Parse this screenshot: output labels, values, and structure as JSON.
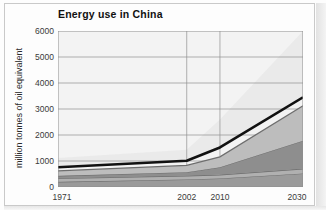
{
  "chart_data": {
    "type": "area",
    "title": "Energy use in China",
    "xlabel": "",
    "ylabel": "million tonnes of oil equivalent",
    "x": [
      1971,
      2002,
      2010,
      2030
    ],
    "x_tick_labels": [
      "1971",
      "2002",
      "2010",
      "2030"
    ],
    "y_tick_labels": [
      "0",
      "1000",
      "2000",
      "3000",
      "4000",
      "5000",
      "6000"
    ],
    "y_ticks": [
      0,
      1000,
      2000,
      3000,
      4000,
      5000,
      6000
    ],
    "ylim": [
      0,
      6000
    ],
    "xlim": [
      1971,
      2030
    ],
    "grid": true,
    "legend": "none",
    "stacked": true,
    "series": [
      {
        "name": "band-1",
        "color": "#9a9a9a",
        "values": [
          200,
          290,
          330,
          520
        ]
      },
      {
        "name": "band-2",
        "color": "#b0b0b0",
        "values": [
          330,
          430,
          470,
          700
        ]
      },
      {
        "name": "band-3",
        "color": "#8e8e8e",
        "values": [
          430,
          570,
          760,
          1780
        ]
      },
      {
        "name": "band-4",
        "color": "#bdbdbd",
        "values": [
          620,
          830,
          1160,
          3120
        ]
      },
      {
        "name": "total-line",
        "color": "#121212",
        "values": [
          760,
          1010,
          1520,
          3450
        ]
      },
      {
        "name": "projection-wedge",
        "color": "#e7e7e7",
        "values": [
          1120,
          1430,
          2600,
          6000
        ]
      }
    ]
  },
  "colors": {
    "plot_background": "#f3f3f3",
    "gridline": "#8f8f8f",
    "axis": "#6f6f6f",
    "total_line": "#121212",
    "page_frame": "#c9c9c9"
  }
}
